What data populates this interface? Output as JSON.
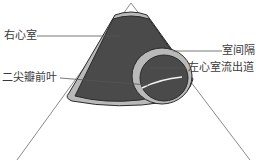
{
  "diagram": {
    "title": "",
    "labels": {
      "right_ventricle": "右心室",
      "anterior_mitral_leaflet": "二尖瓣前叶",
      "ventricular_septum": "室间隔",
      "lvot": "左心室流出道"
    },
    "colors": {
      "chamber_fill": "#4a4a4a",
      "wall_band": "#b9b9b9",
      "outline": "#2a2a2a",
      "sector_line": "#8a8a8a",
      "leader_line": "#555555",
      "leaflet": "#f2f2f2"
    }
  }
}
